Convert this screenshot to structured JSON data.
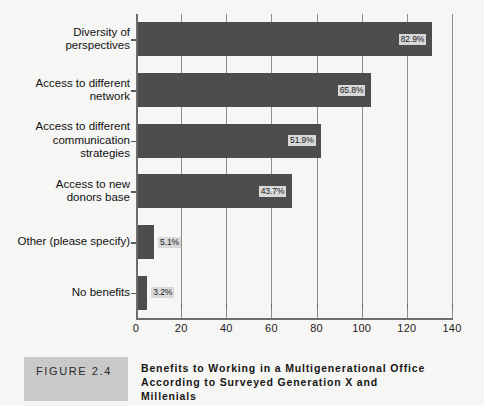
{
  "chart_data": {
    "type": "bar",
    "orientation": "horizontal",
    "title": "Benefits to Working in a Multigenerational Office According to Surveyed Generation X and Millenials",
    "xlabel": "",
    "ylabel": "",
    "xlim": [
      0,
      140
    ],
    "xticks": [
      0,
      20,
      40,
      60,
      80,
      100,
      120,
      140
    ],
    "grid": true,
    "legend": "none",
    "categories": [
      "Diversity of\nperspectives",
      "Access to different\nnetwork",
      "Access to different\ncommunication\nstrategies",
      "Access to new\ndonors base",
      "Other (please specify)",
      "No benefits"
    ],
    "values": [
      131,
      104,
      82,
      69,
      8,
      5
    ],
    "data_labels": [
      "82.9%",
      "65.8%",
      "51.9%",
      "43.7%",
      "5.1%",
      "3.2%"
    ],
    "percentages": [
      82.9,
      65.8,
      51.9,
      43.7,
      5.1,
      3.2
    ],
    "bar_color": "#4d4d4d",
    "label_box_color": "#d9d9d9",
    "background_color": "#f6f6f4",
    "axis_color": "#6d6d6d",
    "gridline_color": "#8f8f8f"
  },
  "caption": {
    "figure_number": "FIGURE 2.4",
    "title": "Benefits to Working in a Multigenerational Office\nAccording to Surveyed Generation X and\nMillenials"
  }
}
